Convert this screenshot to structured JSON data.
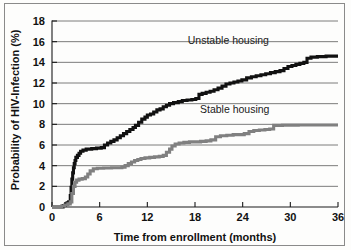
{
  "chart_data": {
    "type": "line",
    "title": "",
    "xlabel": "Time from enrollment (months)",
    "ylabel": "Probability of HIV-Infection (%)",
    "xlim": [
      0,
      36
    ],
    "ylim": [
      0,
      18
    ],
    "xticks": [
      0,
      6,
      12,
      18,
      24,
      30,
      36
    ],
    "yticks": [
      0,
      2,
      4,
      6,
      8,
      10,
      12,
      14,
      16,
      18
    ],
    "grid": "horizontal",
    "legend_position": "inline-annotation",
    "colors": {
      "unstable": "#111111",
      "stable": "#808080",
      "gridline": "#5a5a5a",
      "axis": "#1a1a1a",
      "background": "#fdfdfc",
      "frame": "#8a8a8a"
    },
    "series": [
      {
        "name": "Unstable housing",
        "color": "#111111",
        "step": "post",
        "points": [
          [
            0.0,
            0.0
          ],
          [
            1.1,
            0.0
          ],
          [
            1.4,
            0.15
          ],
          [
            1.7,
            0.3
          ],
          [
            1.9,
            0.4
          ],
          [
            2.1,
            0.5
          ],
          [
            2.3,
            1.1
          ],
          [
            2.4,
            1.9
          ],
          [
            2.5,
            2.7
          ],
          [
            2.6,
            3.3
          ],
          [
            2.7,
            3.8
          ],
          [
            2.8,
            4.2
          ],
          [
            2.9,
            4.5
          ],
          [
            3.0,
            4.8
          ],
          [
            3.2,
            5.0
          ],
          [
            3.4,
            5.2
          ],
          [
            3.6,
            5.4
          ],
          [
            3.9,
            5.5
          ],
          [
            4.3,
            5.6
          ],
          [
            5.0,
            5.65
          ],
          [
            5.6,
            5.7
          ],
          [
            6.2,
            5.75
          ],
          [
            6.6,
            6.0
          ],
          [
            7.0,
            6.2
          ],
          [
            7.4,
            6.35
          ],
          [
            7.8,
            6.5
          ],
          [
            8.2,
            6.7
          ],
          [
            8.6,
            6.9
          ],
          [
            9.0,
            7.1
          ],
          [
            9.4,
            7.3
          ],
          [
            9.8,
            7.5
          ],
          [
            10.2,
            7.7
          ],
          [
            10.5,
            7.9
          ],
          [
            10.9,
            8.2
          ],
          [
            11.3,
            8.5
          ],
          [
            11.7,
            8.7
          ],
          [
            12.0,
            8.9
          ],
          [
            12.4,
            9.0
          ],
          [
            12.8,
            9.2
          ],
          [
            13.2,
            9.4
          ],
          [
            13.6,
            9.5
          ],
          [
            14.0,
            9.7
          ],
          [
            14.4,
            9.85
          ],
          [
            14.8,
            10.0
          ],
          [
            15.3,
            10.1
          ],
          [
            15.9,
            10.2
          ],
          [
            16.4,
            10.3
          ],
          [
            17.0,
            10.35
          ],
          [
            17.6,
            10.4
          ],
          [
            18.1,
            10.5
          ],
          [
            18.5,
            10.9
          ],
          [
            18.9,
            11.0
          ],
          [
            19.4,
            11.1
          ],
          [
            19.9,
            11.2
          ],
          [
            20.4,
            11.35
          ],
          [
            20.9,
            11.5
          ],
          [
            21.4,
            11.7
          ],
          [
            21.9,
            11.9
          ],
          [
            22.4,
            12.0
          ],
          [
            22.9,
            12.1
          ],
          [
            23.4,
            12.2
          ],
          [
            23.9,
            12.3
          ],
          [
            24.5,
            12.5
          ],
          [
            25.1,
            12.6
          ],
          [
            25.7,
            12.7
          ],
          [
            26.3,
            12.8
          ],
          [
            26.9,
            12.9
          ],
          [
            27.5,
            13.0
          ],
          [
            28.1,
            13.1
          ],
          [
            28.7,
            13.2
          ],
          [
            29.2,
            13.4
          ],
          [
            29.7,
            13.6
          ],
          [
            30.2,
            13.7
          ],
          [
            30.7,
            13.8
          ],
          [
            31.2,
            13.9
          ],
          [
            31.7,
            14.0
          ],
          [
            32.1,
            14.4
          ],
          [
            32.6,
            14.5
          ],
          [
            33.4,
            14.55
          ],
          [
            34.5,
            14.6
          ],
          [
            36.0,
            14.6
          ]
        ]
      },
      {
        "name": "Stable housing",
        "color": "#808080",
        "step": "post",
        "points": [
          [
            0.0,
            0.0
          ],
          [
            1.2,
            0.1
          ],
          [
            1.6,
            0.2
          ],
          [
            2.0,
            0.3
          ],
          [
            2.3,
            0.5
          ],
          [
            2.5,
            1.3
          ],
          [
            2.7,
            2.0
          ],
          [
            2.9,
            2.4
          ],
          [
            3.1,
            2.6
          ],
          [
            3.4,
            2.7
          ],
          [
            3.8,
            2.75
          ],
          [
            4.2,
            2.9
          ],
          [
            4.5,
            3.2
          ],
          [
            4.8,
            3.5
          ],
          [
            5.2,
            3.7
          ],
          [
            5.7,
            3.75
          ],
          [
            6.5,
            3.78
          ],
          [
            7.5,
            3.8
          ],
          [
            8.4,
            3.8
          ],
          [
            8.8,
            3.85
          ],
          [
            9.2,
            4.0
          ],
          [
            9.6,
            4.2
          ],
          [
            10.0,
            4.35
          ],
          [
            10.4,
            4.5
          ],
          [
            10.8,
            4.6
          ],
          [
            11.2,
            4.7
          ],
          [
            11.7,
            4.75
          ],
          [
            12.3,
            4.8
          ],
          [
            12.9,
            4.85
          ],
          [
            13.5,
            4.9
          ],
          [
            14.0,
            5.0
          ],
          [
            14.4,
            5.3
          ],
          [
            14.8,
            5.6
          ],
          [
            15.1,
            5.9
          ],
          [
            15.5,
            6.1
          ],
          [
            16.0,
            6.2
          ],
          [
            16.6,
            6.25
          ],
          [
            17.3,
            6.3
          ],
          [
            18.0,
            6.3
          ],
          [
            18.7,
            6.35
          ],
          [
            19.4,
            6.4
          ],
          [
            20.0,
            6.5
          ],
          [
            20.6,
            6.8
          ],
          [
            21.2,
            6.9
          ],
          [
            22.0,
            6.95
          ],
          [
            22.8,
            7.0
          ],
          [
            23.6,
            7.0
          ],
          [
            24.2,
            7.1
          ],
          [
            24.8,
            7.3
          ],
          [
            25.4,
            7.4
          ],
          [
            26.1,
            7.45
          ],
          [
            26.8,
            7.5
          ],
          [
            27.4,
            7.55
          ],
          [
            27.9,
            7.9
          ],
          [
            29.0,
            7.92
          ],
          [
            31.0,
            7.93
          ],
          [
            33.0,
            7.93
          ],
          [
            36.0,
            7.93
          ]
        ]
      }
    ],
    "annotations": [
      {
        "text": "Unstable housing",
        "x": 22.2,
        "y": 15.8,
        "anchor": "middle"
      },
      {
        "text": "Stable housing",
        "x": 23.0,
        "y": 9.1,
        "anchor": "middle"
      }
    ]
  }
}
